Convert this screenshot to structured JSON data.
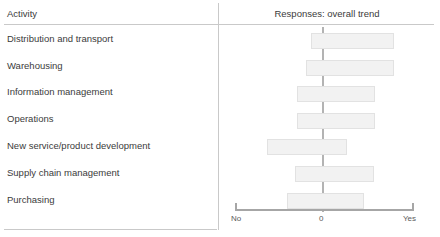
{
  "table": {
    "columns": {
      "activity_header": "Activity",
      "responses_header": "Responses: overall trend"
    }
  },
  "colors": {
    "bar_fill": "#f2f2f2",
    "bar_border": "#e2e2e2",
    "zero_line": "#b3b3b3",
    "axis": "#a6a6a6",
    "rule": "#c9c9c9",
    "text": "#3b3b3b"
  },
  "chart_data": {
    "type": "bar",
    "orientation": "horizontal",
    "title": "Responses: overall trend",
    "xlabel": "",
    "ylabel": "Activity",
    "xlim": [
      -1,
      1
    ],
    "grid": false,
    "legend": null,
    "axis_ticks": [
      {
        "label": "No",
        "value": -1
      },
      {
        "label": "0",
        "value": 0
      },
      {
        "label": "Yes",
        "value": 1
      }
    ],
    "note": "Each bar is a floating range (box) spanning from its low to high response value on a No(-1) to Yes(+1) scale; the vertical reference line marks 0.",
    "categories": [
      "Distribution and transport",
      "Warehousing",
      "Information management",
      "Operations",
      "New service/product development",
      "Supply chain management",
      "Purchasing"
    ],
    "ranges": [
      {
        "category": "Distribution and transport",
        "low": -0.15,
        "high": 0.78
      },
      {
        "category": "Warehousing",
        "low": -0.21,
        "high": 0.78
      },
      {
        "category": "Information management",
        "low": -0.31,
        "high": 0.56
      },
      {
        "category": "Operations",
        "low": -0.31,
        "high": 0.56
      },
      {
        "category": "New service/product development",
        "low": -0.64,
        "high": 0.25
      },
      {
        "category": "Supply chain management",
        "low": -0.33,
        "high": 0.55
      },
      {
        "category": "Purchasing",
        "low": -0.42,
        "high": 0.44
      }
    ]
  }
}
